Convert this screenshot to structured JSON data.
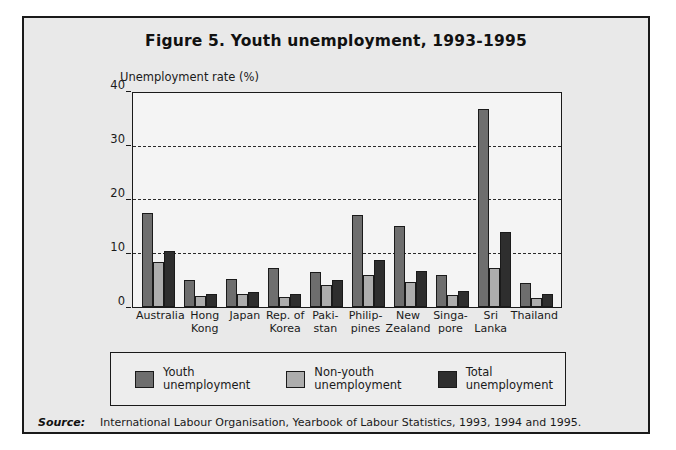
{
  "figure": {
    "title": "Figure 5.  Youth unemployment, 1993-1995",
    "source_label": "Source:",
    "source_text": "International Labour Organisation, Yearbook of Labour Statistics, 1993, 1994 and 1995."
  },
  "legend": {
    "items": [
      {
        "line1": "Youth",
        "line2": "unemployment",
        "color": "#6e6e6e",
        "key": "youth"
      },
      {
        "line1": "Non-youth",
        "line2": "unemployment",
        "color": "#adadad",
        "key": "non-youth"
      },
      {
        "line1": "Total",
        "line2": "unemployment",
        "color": "#2e2e2e",
        "key": "total"
      }
    ]
  },
  "xlabels": [
    {
      "line1": "Australia",
      "line2": ""
    },
    {
      "line1": "Hong",
      "line2": "Kong"
    },
    {
      "line1": "Japan",
      "line2": ""
    },
    {
      "line1": "Rep. of",
      "line2": "Korea"
    },
    {
      "line1": "Paki-",
      "line2": "stan"
    },
    {
      "line1": "Philip-",
      "line2": "pines"
    },
    {
      "line1": "New",
      "line2": "Zealand"
    },
    {
      "line1": "Singa-",
      "line2": "pore"
    },
    {
      "line1": "Sri",
      "line2": "Lanka"
    },
    {
      "line1": "Thailand",
      "line2": ""
    }
  ],
  "chart_data": {
    "type": "bar",
    "title": "Figure 5.  Youth unemployment, 1993-1995",
    "ylabel": "Unemployment rate (%)",
    "xlabel": "",
    "ylim": [
      0,
      40
    ],
    "yticks": [
      0,
      10,
      20,
      30,
      40
    ],
    "ytick_labels": [
      "0",
      "10",
      "20",
      "30",
      "40"
    ],
    "gridlines": [
      10,
      20,
      30
    ],
    "grid": true,
    "legend_position": "below-plot",
    "categories": [
      "Australia",
      "Hong Kong",
      "Japan",
      "Rep. of Korea",
      "Pakistan",
      "Philippines",
      "New Zealand",
      "Singapore",
      "Sri Lanka",
      "Thailand"
    ],
    "series": [
      {
        "name": "Youth unemployment",
        "color": "#6e6e6e",
        "values": [
          17.6,
          5.0,
          5.2,
          7.2,
          6.5,
          17.2,
          15.2,
          6.0,
          37.0,
          4.5
        ]
      },
      {
        "name": "Non-youth unemployment",
        "color": "#adadad",
        "values": [
          8.4,
          2.0,
          2.5,
          1.8,
          4.2,
          6.0,
          4.7,
          2.2,
          7.2,
          1.7
        ]
      },
      {
        "name": "Total unemployment",
        "color": "#2e2e2e",
        "values": [
          10.4,
          2.5,
          2.8,
          2.5,
          5.0,
          8.7,
          6.8,
          3.0,
          14.0,
          2.5
        ]
      }
    ]
  }
}
